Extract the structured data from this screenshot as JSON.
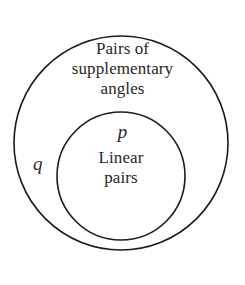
{
  "diagram": {
    "type": "euler-diagram",
    "background_color": "#ffffff",
    "stroke_color": "#1a1a1a",
    "text_color": "#2b2724",
    "outer_set": {
      "variable": "q",
      "label_line_1": "Pairs of",
      "label_line_2": "supplementary",
      "label_line_3": "angles",
      "center_x": 121,
      "center_y": 143,
      "radius": 107
    },
    "inner_set": {
      "variable": "p",
      "label_line_1": "Linear",
      "label_line_2": "pairs",
      "center_x": 121,
      "center_y": 176,
      "radius": 64
    }
  }
}
